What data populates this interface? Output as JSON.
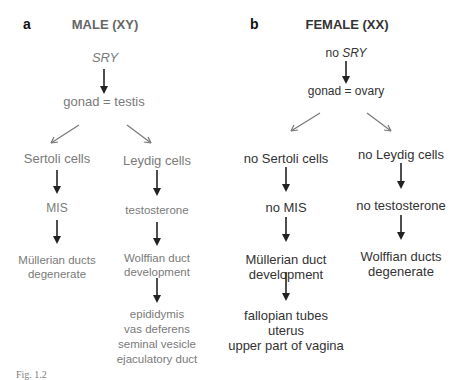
{
  "panel_a": {
    "letter": "a",
    "title": "MALE (XY)",
    "start": "SRY",
    "gonad": "gonad = testis",
    "left_branch": [
      "Sertoli cells",
      "MIS",
      "Müllerian ducts",
      "degenerate"
    ],
    "right_branch": [
      "Leydig cells",
      "testosterone",
      "Wolffian duct",
      "development"
    ],
    "outcome": [
      "epididymis",
      "vas deferens",
      "seminal vesicle",
      "ejaculatory duct"
    ]
  },
  "panel_b": {
    "letter": "b",
    "title": "FEMALE (XX)",
    "start_prefix": "no ",
    "start_gene": "SRY",
    "gonad": "gonad = ovary",
    "left_branch": [
      "no Sertoli cells",
      "no MIS",
      "Müllerian duct",
      "development"
    ],
    "right_branch": [
      "no Leydig cells",
      "no testosterone",
      "Wolffian ducts",
      "degenerate"
    ],
    "outcome": [
      "fallopian tubes",
      "uterus",
      "upper part of vagina"
    ]
  },
  "caption": "Fig. 1.2"
}
